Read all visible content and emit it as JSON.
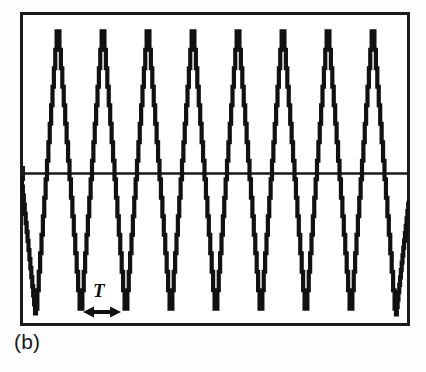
{
  "figure": {
    "caption": "(b)",
    "period_label": "T",
    "background_color": "#fdfdfd",
    "trace_color": "#111111",
    "frame_color": "#1a1a1a"
  },
  "annotations": {
    "period_marker": {
      "label": "T",
      "icon": "double-headed-arrow-icon",
      "x_start": 84,
      "x_end": 120,
      "y": 312
    },
    "zero_tick": {
      "icon": "axis-tick-icon",
      "x": 22,
      "y": 173
    }
  },
  "chart_data": {
    "type": "line",
    "title": "",
    "subtitle": "",
    "xlabel": "",
    "ylabel": "",
    "grid": false,
    "legend": null,
    "waveform": "triangular",
    "quantized": true,
    "quantization_steps": 16,
    "cycles_visible": 8,
    "period_px": 45,
    "first_peak_x": 58,
    "first_trough_x": 36,
    "peak_y": 22,
    "trough_y": 318,
    "zero_line_y": 173,
    "frame": {
      "left": 21,
      "top": 13,
      "right": 409,
      "bottom": 325
    },
    "peaks_x": [
      58,
      103,
      148,
      193,
      238,
      283,
      328,
      373
    ],
    "troughs_x": [
      36,
      81,
      126,
      171,
      216,
      261,
      306,
      351,
      396
    ],
    "series": [
      {
        "name": "signal",
        "x": [
          21,
          36,
          58,
          81,
          103,
          126,
          148,
          171,
          193,
          216,
          238,
          261,
          283,
          306,
          328,
          351,
          373,
          396,
          409
        ],
        "y": [
          173,
          318,
          22,
          318,
          22,
          318,
          22,
          318,
          22,
          318,
          22,
          318,
          22,
          318,
          22,
          318,
          22,
          318,
          200
        ]
      }
    ],
    "ylim": [
      318,
      22
    ],
    "xlim": [
      21,
      409
    ],
    "annotations": [
      {
        "text": "T",
        "type": "period-span",
        "x_start": 84,
        "x_end": 120,
        "y": 312
      },
      {
        "text": "(b)",
        "type": "subfigure-caption",
        "x": 14,
        "y": 331
      }
    ]
  }
}
